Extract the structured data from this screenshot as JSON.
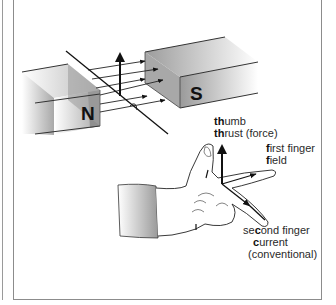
{
  "diagram": {
    "magnets": {
      "north_label": "N",
      "south_label": "S"
    },
    "labels": {
      "thumb": {
        "bold": "th",
        "rest": "umb"
      },
      "thrust": {
        "bold": "th",
        "rest": "rust (force)"
      },
      "first_finger": {
        "bold": "f",
        "rest": "irst finger"
      },
      "field": {
        "bold": "f",
        "rest": "ield"
      },
      "second_finger": {
        "pre": "se",
        "bold": "c",
        "rest": "ond finger"
      },
      "current": {
        "bold": "c",
        "rest": "urrent"
      },
      "conventional": "(conventional)"
    },
    "colors": {
      "magnet_face": "#8e8e8e",
      "magnet_top": "#b4b4b4",
      "line": "#1a1a1a",
      "frame": "#8c8c8c"
    }
  }
}
